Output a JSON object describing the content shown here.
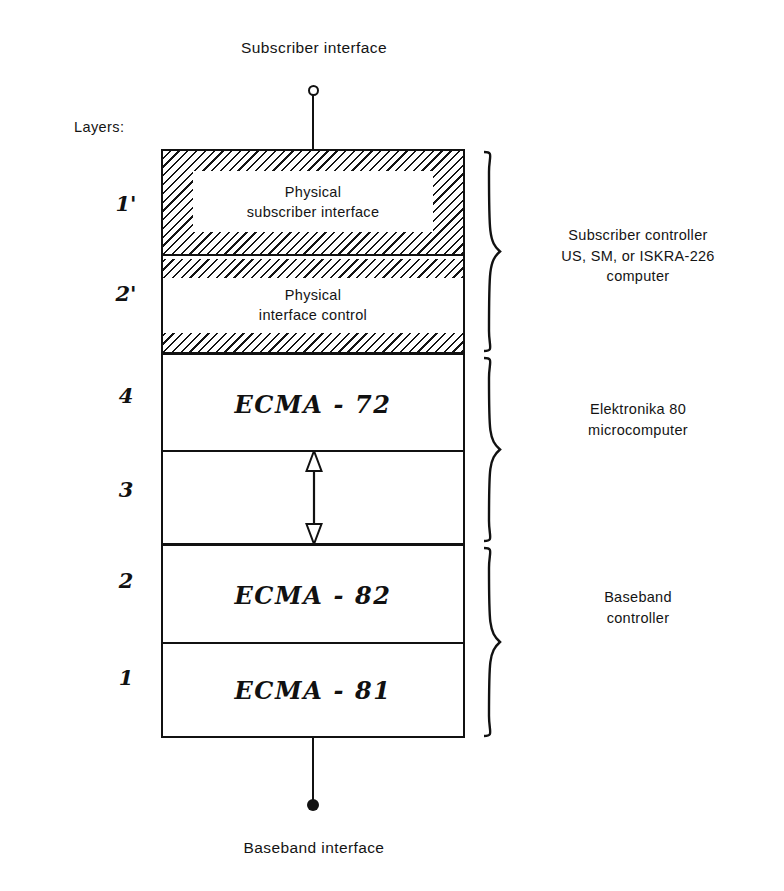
{
  "diagram": {
    "top_interface_label": "Subscriber interface",
    "bottom_interface_label": "Baseband interface",
    "layers_caption": "Layers:",
    "layers": [
      {
        "id": "1p",
        "number": "1'",
        "label_line1": "Physical",
        "label_line2": "subscriber interface",
        "style": "hatched-ring"
      },
      {
        "id": "2p",
        "number": "2'",
        "label_line1": "Physical",
        "label_line2": "interface control",
        "style": "hatched-strips"
      },
      {
        "id": "4",
        "number": "4",
        "label": "ECMA - 72",
        "style": "plain"
      },
      {
        "id": "3",
        "number": "3",
        "label": "",
        "style": "arrow"
      },
      {
        "id": "2",
        "number": "2",
        "label": "ECMA - 82",
        "style": "plain"
      },
      {
        "id": "1",
        "number": "1",
        "label": "ECMA - 81",
        "style": "plain"
      }
    ],
    "groups": [
      {
        "id": "subscriber-controller",
        "line1": "Subscriber controller",
        "line2": "US, SM, or ISKRA-226",
        "line3": "computer",
        "covers": [
          "1'",
          "2'"
        ]
      },
      {
        "id": "elektronika",
        "line1": "Elektronika 80",
        "line2": "microcomputer",
        "line3": "",
        "covers": [
          "4",
          "3"
        ]
      },
      {
        "id": "baseband-controller",
        "line1": "Baseband",
        "line2": "controller",
        "line3": "",
        "covers": [
          "2",
          "1"
        ]
      }
    ],
    "colors": {
      "ink": "#111111",
      "background": "#ffffff"
    }
  }
}
